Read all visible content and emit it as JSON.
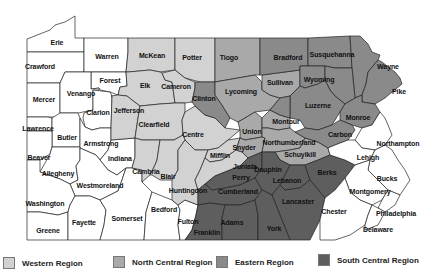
{
  "map": {
    "title": "Pennsylvania Regions",
    "colors": {
      "white": "#ffffff",
      "light": "#d2d2d2",
      "mid": "#a9a9a9",
      "dark": "#8a8a8a",
      "darkest": "#5e5e5e"
    },
    "counties": [
      {
        "name": "Erie",
        "x": 57,
        "y": 42
      },
      {
        "name": "Crawford",
        "x": 40,
        "y": 66
      },
      {
        "name": "Warren",
        "x": 107,
        "y": 56
      },
      {
        "name": "McKean",
        "x": 152,
        "y": 55
      },
      {
        "name": "Potter",
        "x": 192,
        "y": 57
      },
      {
        "name": "Tiogo",
        "x": 229,
        "y": 57
      },
      {
        "name": "Bradford",
        "x": 288,
        "y": 57
      },
      {
        "name": "Susquehanna",
        "x": 332,
        "y": 54
      },
      {
        "name": "Wayne",
        "x": 388,
        "y": 66
      },
      {
        "name": "Forest",
        "x": 110,
        "y": 80
      },
      {
        "name": "Elk",
        "x": 145,
        "y": 85
      },
      {
        "name": "Cameron",
        "x": 176,
        "y": 86
      },
      {
        "name": "Sullivan",
        "x": 280,
        "y": 82
      },
      {
        "name": "Wyoming",
        "x": 319,
        "y": 79
      },
      {
        "name": "Pike",
        "x": 399,
        "y": 91
      },
      {
        "name": "Mercer",
        "x": 44,
        "y": 99
      },
      {
        "name": "Venango",
        "x": 81,
        "y": 93
      },
      {
        "name": "Clinton",
        "x": 204,
        "y": 98
      },
      {
        "name": "Lycoming",
        "x": 241,
        "y": 91
      },
      {
        "name": "Clarion",
        "x": 98,
        "y": 112
      },
      {
        "name": "Jefferson",
        "x": 129,
        "y": 110
      },
      {
        "name": "Luzerne",
        "x": 318,
        "y": 105
      },
      {
        "name": "Monroe",
        "x": 358,
        "y": 117
      },
      {
        "name": "Lawrence",
        "x": 38,
        "y": 128
      },
      {
        "name": "Clearfield",
        "x": 154,
        "y": 124
      },
      {
        "name": "Montour",
        "x": 286,
        "y": 121
      },
      {
        "name": "Centre",
        "x": 193,
        "y": 134
      },
      {
        "name": "Union",
        "x": 252,
        "y": 131
      },
      {
        "name": "Carbon",
        "x": 340,
        "y": 134
      },
      {
        "name": "Butler",
        "x": 67,
        "y": 137
      },
      {
        "name": "Armstrong",
        "x": 101,
        "y": 143
      },
      {
        "name": "Snyder",
        "x": 244,
        "y": 147
      },
      {
        "name": "Northumberland",
        "x": 289,
        "y": 142
      },
      {
        "name": "Northampton",
        "x": 398,
        "y": 143
      },
      {
        "name": "Beaver",
        "x": 39,
        "y": 157
      },
      {
        "name": "Mifflin",
        "x": 220,
        "y": 155
      },
      {
        "name": "Schuylkill",
        "x": 300,
        "y": 154
      },
      {
        "name": "Lehigh",
        "x": 368,
        "y": 157
      },
      {
        "name": "Indiana",
        "x": 120,
        "y": 158
      },
      {
        "name": "Juniata",
        "x": 245,
        "y": 166
      },
      {
        "name": "Allegheny",
        "x": 58,
        "y": 173
      },
      {
        "name": "Cambria",
        "x": 146,
        "y": 171
      },
      {
        "name": "Blair",
        "x": 168,
        "y": 176
      },
      {
        "name": "Perry",
        "x": 241,
        "y": 177
      },
      {
        "name": "Dauphin",
        "x": 268,
        "y": 169
      },
      {
        "name": "Berks",
        "x": 327,
        "y": 172
      },
      {
        "name": "Westmoreland",
        "x": 100,
        "y": 185
      },
      {
        "name": "Huntingdon",
        "x": 188,
        "y": 190
      },
      {
        "name": "Lebanon",
        "x": 287,
        "y": 180
      },
      {
        "name": "Bucks",
        "x": 387,
        "y": 178
      },
      {
        "name": "Cumberland",
        "x": 238,
        "y": 191
      },
      {
        "name": "Montgomery",
        "x": 370,
        "y": 191
      },
      {
        "name": "Washington",
        "x": 45,
        "y": 203
      },
      {
        "name": "Lancaster",
        "x": 298,
        "y": 201
      },
      {
        "name": "Bedford",
        "x": 164,
        "y": 209
      },
      {
        "name": "Fayette",
        "x": 84,
        "y": 222
      },
      {
        "name": "Somerset",
        "x": 127,
        "y": 218
      },
      {
        "name": "Chester",
        "x": 334,
        "y": 211
      },
      {
        "name": "Philadelphia",
        "x": 396,
        "y": 213
      },
      {
        "name": "Fulton",
        "x": 188,
        "y": 221
      },
      {
        "name": "Adams",
        "x": 232,
        "y": 222
      },
      {
        "name": "Greene",
        "x": 48,
        "y": 230
      },
      {
        "name": "Franklin",
        "x": 207,
        "y": 232
      },
      {
        "name": "York",
        "x": 274,
        "y": 228
      },
      {
        "name": "Delaware",
        "x": 378,
        "y": 229
      }
    ]
  },
  "legend": {
    "items": [
      {
        "label": "Western Region",
        "color": "#d2d2d2"
      },
      {
        "label": "North Central Region",
        "color": "#a9a9a9"
      },
      {
        "label": "Eastern Region",
        "color": "#8a8a8a"
      },
      {
        "label": "South Central Region",
        "color": "#5e5e5e"
      }
    ]
  }
}
